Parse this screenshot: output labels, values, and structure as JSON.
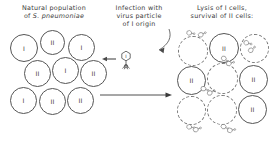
{
  "figure": {
    "type": "diagram",
    "background_color": "#ffffff",
    "ink_color": "#3a3a3a"
  },
  "panels": {
    "left": {
      "caption_line1": "Natural population",
      "caption_line2_prefix": "of",
      "caption_line2_species": "S. pneumoniae",
      "cells": [
        {
          "label": "I",
          "state": "intact"
        },
        {
          "label": "II",
          "state": "intact"
        },
        {
          "label": "I",
          "state": "intact"
        },
        {
          "label": "II",
          "state": "intact"
        },
        {
          "label": "I",
          "state": "intact"
        },
        {
          "label": "II",
          "state": "intact"
        },
        {
          "label": "I",
          "state": "intact"
        },
        {
          "label": "II",
          "state": "intact"
        },
        {
          "label": "II",
          "state": "intact"
        }
      ]
    },
    "middle": {
      "caption_line1": "Infection with",
      "caption_line2": "virus particle",
      "caption_line3": "of I origin",
      "virus_label": "I",
      "arrow_direction": "right"
    },
    "right": {
      "caption_line1": "Lysis of I cells,",
      "caption_line2": "survival of II cells:",
      "cells": [
        {
          "label": "",
          "state": "lysed"
        },
        {
          "label": "II",
          "state": "intact"
        },
        {
          "label": "",
          "state": "lysed"
        },
        {
          "label": "II",
          "state": "intact"
        },
        {
          "label": "",
          "state": "lysed"
        },
        {
          "label": "II",
          "state": "intact"
        },
        {
          "label": "",
          "state": "lysed"
        },
        {
          "label": "",
          "state": "lysed"
        },
        {
          "label": "II",
          "state": "intact"
        }
      ],
      "free_virus_count": 9
    }
  }
}
